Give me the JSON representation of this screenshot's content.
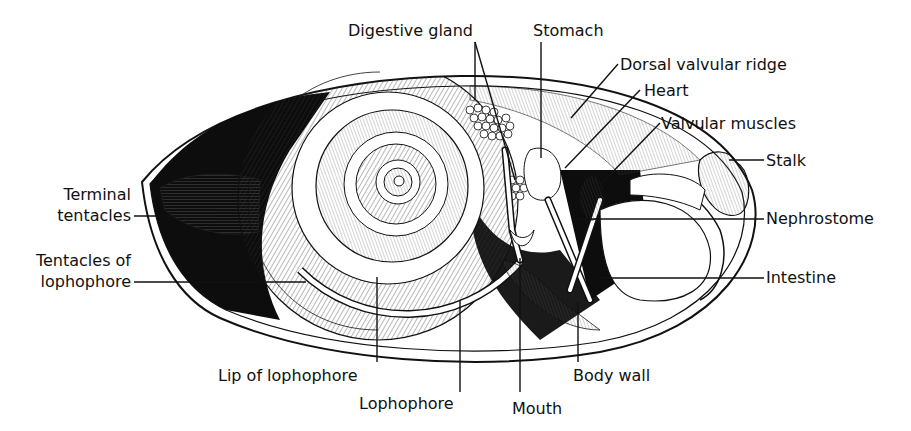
{
  "diagram": {
    "type": "anatomical-illustration",
    "colors": {
      "ink": "#111111",
      "paper": "#ffffff",
      "fill_dark": "#0d0d0d",
      "hatch": "#444444"
    },
    "labels": [
      {
        "id": "digestive-gland",
        "text": "Digestive gland",
        "x": 348,
        "y": 36,
        "anchor": "start",
        "lines": [
          [
            475,
            42,
            475,
            100
          ],
          [
            475,
            42,
            515,
            180
          ]
        ]
      },
      {
        "id": "stomach",
        "text": "Stomach",
        "x": 533,
        "y": 36,
        "anchor": "start",
        "lines": [
          [
            541,
            42,
            541,
            158
          ]
        ]
      },
      {
        "id": "dorsal-valvular-ridge",
        "text": "Dorsal valvular ridge",
        "x": 620,
        "y": 70,
        "anchor": "start",
        "lines": [
          [
            618,
            64,
            571,
            118
          ]
        ]
      },
      {
        "id": "heart",
        "text": "Heart",
        "x": 644,
        "y": 96,
        "anchor": "start",
        "lines": [
          [
            640,
            90,
            565,
            168
          ]
        ]
      },
      {
        "id": "valvular-muscles",
        "text": "Valvular muscles",
        "x": 661,
        "y": 129,
        "anchor": "start",
        "lines": [
          [
            660,
            123,
            600,
            185
          ]
        ]
      },
      {
        "id": "stalk",
        "text": "Stalk",
        "x": 766,
        "y": 166,
        "anchor": "start",
        "lines": [
          [
            729,
            160,
            764,
            160
          ]
        ]
      },
      {
        "id": "nephrostome",
        "text": "Nephrostome",
        "x": 766,
        "y": 224,
        "anchor": "start",
        "lines": [
          [
            575,
            219,
            764,
            219
          ]
        ]
      },
      {
        "id": "intestine",
        "text": "Intestine",
        "x": 766,
        "y": 283,
        "anchor": "start",
        "lines": [
          [
            596,
            278,
            764,
            278
          ]
        ]
      },
      {
        "id": "terminal-tentacles",
        "text": [
          "Terminal",
          "tentacles"
        ],
        "x": 131,
        "y": 200,
        "anchor": "end",
        "lines": [
          [
            134,
            216,
            216,
            216
          ]
        ]
      },
      {
        "id": "tentacles-of-lophophore",
        "text": [
          "Tentacles of",
          "lophophore"
        ],
        "x": 131,
        "y": 266,
        "anchor": "end",
        "lines": [
          [
            134,
            282,
            306,
            282
          ]
        ]
      },
      {
        "id": "lip-of-lophophore",
        "text": "Lip of lophophore",
        "x": 218,
        "y": 381,
        "anchor": "start",
        "lines": [
          [
            377,
            277,
            377,
            362
          ]
        ]
      },
      {
        "id": "lophophore",
        "text": "Lophophore",
        "x": 359,
        "y": 409,
        "anchor": "start",
        "lines": [
          [
            460,
            300,
            460,
            392
          ]
        ]
      },
      {
        "id": "mouth",
        "text": "Mouth",
        "x": 512,
        "y": 414,
        "anchor": "start",
        "lines": [
          [
            520,
            258,
            520,
            392
          ]
        ]
      },
      {
        "id": "body-wall",
        "text": "Body wall",
        "x": 573,
        "y": 381,
        "anchor": "start",
        "lines": [
          [
            578,
            302,
            578,
            362
          ]
        ]
      }
    ]
  }
}
